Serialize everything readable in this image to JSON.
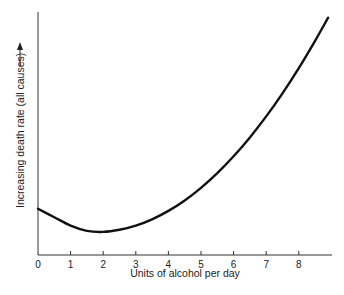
{
  "chart_data": {
    "type": "line",
    "title": "",
    "xlabel": "Units of alcohol per day",
    "ylabel": "Increasing death rate (all causes)",
    "ylabel_arrow": true,
    "x_ticks": [
      0,
      1,
      2,
      3,
      4,
      5,
      6,
      7,
      8
    ],
    "xlim": [
      0,
      9
    ],
    "y_ticks": [],
    "grid": false,
    "legend": null,
    "series": [
      {
        "name": "Death rate (relative)",
        "color": "#111111",
        "x": [
          0,
          0.5,
          1,
          1.5,
          2,
          2.5,
          3,
          3.5,
          4,
          4.5,
          5,
          5.5,
          6,
          6.5,
          7,
          7.5,
          8,
          8.5,
          8.9
        ],
        "y": [
          22,
          18,
          14,
          11.5,
          11,
          12,
          14,
          17,
          21,
          26,
          32,
          39,
          47,
          56,
          66,
          77,
          89,
          102,
          113
        ]
      }
    ],
    "y_scale_note": "relative units, no numeric y-axis shown"
  }
}
